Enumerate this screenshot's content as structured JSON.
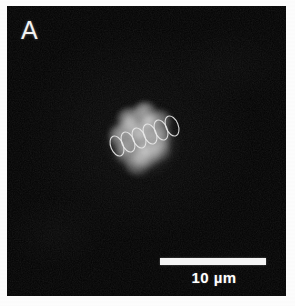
{
  "figure": {
    "domain": "microscopy-fluorescence-micrograph",
    "panel_label": "A",
    "page_background_color": "#fdfdfd",
    "panel_background_color": "#030303",
    "panel_rect": {
      "x": 7,
      "y": 6,
      "width": 279,
      "height": 290
    }
  },
  "scale_bar": {
    "label": "10 µm",
    "value": 10,
    "unit": "µm",
    "bar_color": "#f4f4f4",
    "bar_length_px": 106,
    "bar_height_px": 7,
    "position": "bottom-right"
  },
  "specimen": {
    "name": "cell-cluster",
    "description_color": "#c8c8c8",
    "center": {
      "x": 136,
      "y": 135
    },
    "approx_diameter_px": 60,
    "lobes": [
      {
        "left": 22,
        "top": 14,
        "width": 26,
        "height": 24,
        "brightness": "0.58"
      },
      {
        "left": 38,
        "top": 8,
        "width": 24,
        "height": 23,
        "brightness": "0.66"
      },
      {
        "left": 52,
        "top": 16,
        "width": 25,
        "height": 24,
        "brightness": "0.52"
      },
      {
        "left": 14,
        "top": 30,
        "width": 26,
        "height": 26,
        "brightness": "0.62"
      },
      {
        "left": 32,
        "top": 28,
        "width": 28,
        "height": 27,
        "brightness": "0.74"
      },
      {
        "left": 50,
        "top": 32,
        "width": 27,
        "height": 26,
        "brightness": "0.60"
      },
      {
        "left": 20,
        "top": 46,
        "width": 26,
        "height": 25,
        "brightness": "0.55"
      },
      {
        "left": 38,
        "top": 48,
        "width": 28,
        "height": 26,
        "brightness": "0.78"
      },
      {
        "left": 54,
        "top": 46,
        "width": 22,
        "height": 22,
        "brightness": "0.48"
      },
      {
        "left": 30,
        "top": 60,
        "width": 26,
        "height": 22,
        "brightness": "0.50"
      },
      {
        "left": 44,
        "top": 20,
        "width": 20,
        "height": 19,
        "brightness": "0.70"
      },
      {
        "left": 26,
        "top": 22,
        "width": 20,
        "height": 19,
        "brightness": "0.56"
      }
    ]
  },
  "annotations": {
    "name": "traced-cell-outline-chain",
    "count": 6,
    "stroke_color": "#e8e8e8",
    "stroke_width": 1.1,
    "rotation_deg": -22,
    "ellipses": [
      {
        "cx": 22,
        "cy": 52,
        "rx": 6.2,
        "ry": 10.5,
        "rotate": -22
      },
      {
        "cx": 33,
        "cy": 48,
        "rx": 6.2,
        "ry": 10.5,
        "rotate": -22
      },
      {
        "cx": 44,
        "cy": 44,
        "rx": 6.2,
        "ry": 10.5,
        "rotate": -22
      },
      {
        "cx": 55,
        "cy": 40,
        "rx": 6.2,
        "ry": 10.5,
        "rotate": -22
      },
      {
        "cx": 66,
        "cy": 36,
        "rx": 6.2,
        "ry": 10.5,
        "rotate": -22
      },
      {
        "cx": 77,
        "cy": 32,
        "rx": 6.2,
        "ry": 10.5,
        "rotate": -22
      }
    ]
  }
}
